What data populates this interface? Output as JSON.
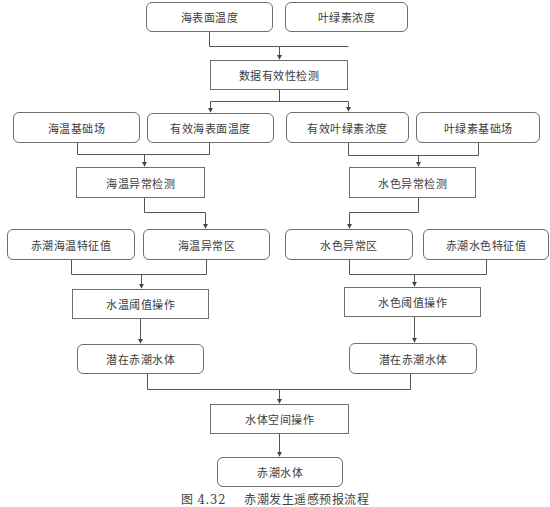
{
  "diagram": {
    "type": "flowchart",
    "nodes": {
      "sst": "海表面温度",
      "chl": "叶绿素浓度",
      "validity_check": "数据有效性检测",
      "sst_base": "海温基础场",
      "valid_sst": "有效海表面温度",
      "valid_chl": "有效叶绿素浓度",
      "chl_base": "叶绿素基础场",
      "sst_anomaly_detect": "海温异常检测",
      "color_anomaly_detect": "水色异常检测",
      "hab_sst_feature": "赤潮海温特征值",
      "sst_anomaly_area": "海温异常区",
      "color_anomaly_area": "水色异常区",
      "hab_color_feature": "赤潮水色特征值",
      "sst_threshold_op": "水温阈值操作",
      "color_threshold_op": "水色阈值操作",
      "potential_hab_left": "潜在赤潮水体",
      "potential_hab_right": "潜在赤潮水体",
      "spatial_op": "水体空间操作",
      "hab_water": "赤潮水体"
    },
    "edges": [
      [
        "sst",
        "validity_check"
      ],
      [
        "chl",
        "validity_check"
      ],
      [
        "validity_check",
        "valid_sst"
      ],
      [
        "validity_check",
        "valid_chl"
      ],
      [
        "sst_base",
        "sst_anomaly_detect"
      ],
      [
        "valid_sst",
        "sst_anomaly_detect"
      ],
      [
        "valid_chl",
        "color_anomaly_detect"
      ],
      [
        "chl_base",
        "color_anomaly_detect"
      ],
      [
        "sst_anomaly_detect",
        "sst_anomaly_area"
      ],
      [
        "color_anomaly_detect",
        "color_anomaly_area"
      ],
      [
        "hab_sst_feature",
        "sst_threshold_op"
      ],
      [
        "sst_anomaly_area",
        "sst_threshold_op"
      ],
      [
        "color_anomaly_area",
        "color_threshold_op"
      ],
      [
        "hab_color_feature",
        "color_threshold_op"
      ],
      [
        "sst_threshold_op",
        "potential_hab_left"
      ],
      [
        "color_threshold_op",
        "potential_hab_right"
      ],
      [
        "potential_hab_left",
        "spatial_op"
      ],
      [
        "potential_hab_right",
        "spatial_op"
      ],
      [
        "spatial_op",
        "hab_water"
      ]
    ]
  },
  "caption": {
    "number": "图 4.32",
    "title": "赤潮发生遥感预报流程"
  },
  "colors": {
    "line": "#555555",
    "border": "#6e6e6e",
    "text": "#3c3c3c"
  }
}
